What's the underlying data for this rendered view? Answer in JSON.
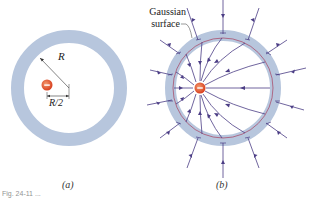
{
  "figure": {
    "panel_a": {
      "label": "(a)",
      "radius_label": "R",
      "offset_label": "R/2",
      "charge_sign": "−"
    },
    "panel_b": {
      "label": "(b)",
      "gaussian_label_line1": "Gaussian",
      "gaussian_label_line2": "surface",
      "charge_sign": "−"
    },
    "caption": "Fig. 24-11 ..."
  },
  "colors": {
    "shell": "#b7c6dd",
    "field_line": "#4b3d85",
    "gaussian_surface": "#a8415e",
    "charge": "#e0522f"
  }
}
